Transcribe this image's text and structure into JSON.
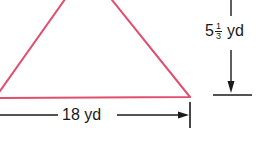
{
  "figure": {
    "type": "triangle",
    "stroke_color": "#e0506e",
    "dimension_color": "#1a1a1a"
  },
  "base": {
    "label": "18 yd"
  },
  "height": {
    "whole": "5",
    "numerator": "1",
    "denominator": "3",
    "unit": "yd"
  }
}
